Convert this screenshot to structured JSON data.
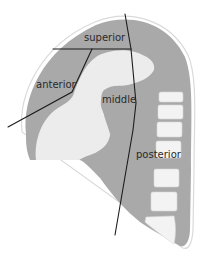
{
  "diagram": {
    "type": "anatomical-sagittal-section",
    "labels": {
      "superior": "superior",
      "anterior": "anterior",
      "middle": "middle",
      "posterior": "posterior"
    },
    "colors": {
      "tissue_gray": "#a9a9a9",
      "light_region": "#ececec",
      "vertebra": "#f2f2f2",
      "outline": "#d6d6d6",
      "division_line": "#1c1c1c",
      "label_text": "#2a2a2a",
      "background": "#ffffff"
    }
  }
}
